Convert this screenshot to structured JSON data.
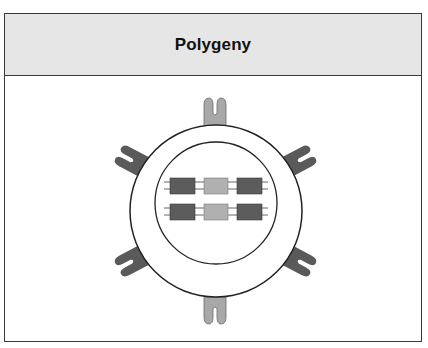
{
  "header": {
    "title": "Polygeny"
  },
  "diagram": {
    "cell": {
      "outer_membrane": "outer-circle",
      "nucleus": "inner-circle"
    },
    "receptors": [
      {
        "position": "top",
        "shade": "light",
        "color": "#a8a8a8"
      },
      {
        "position": "upper-left",
        "shade": "dark",
        "color": "#5a5a5a"
      },
      {
        "position": "upper-right",
        "shade": "dark",
        "color": "#5a5a5a"
      },
      {
        "position": "lower-left",
        "shade": "dark",
        "color": "#5a5a5a"
      },
      {
        "position": "lower-right",
        "shade": "dark",
        "color": "#5a5a5a"
      },
      {
        "position": "bottom",
        "shade": "light",
        "color": "#a8a8a8"
      }
    ],
    "chromosomes": [
      {
        "genes": [
          {
            "shade": "dark",
            "color": "#5c5c5c"
          },
          {
            "shade": "light",
            "color": "#b0b0b0"
          },
          {
            "shade": "dark",
            "color": "#5c5c5c"
          }
        ]
      },
      {
        "genes": [
          {
            "shade": "dark",
            "color": "#5c5c5c"
          },
          {
            "shade": "light",
            "color": "#b0b0b0"
          },
          {
            "shade": "dark",
            "color": "#5c5c5c"
          }
        ]
      }
    ]
  },
  "colors": {
    "header_bg": "#e6e6e6",
    "border": "#3a3a3a",
    "dark_gene": "#5c5c5c",
    "light_gene": "#b0b0b0"
  }
}
